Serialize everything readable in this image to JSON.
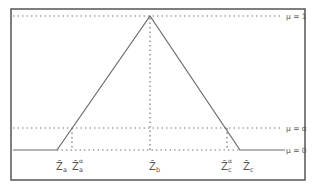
{
  "diagram": {
    "type": "trapezoid-free triangular fuzzy membership function",
    "levels": [
      {
        "id": "mu1",
        "label": "μ = 1"
      },
      {
        "id": "mualpha",
        "label": "μ = α"
      },
      {
        "id": "mu0",
        "label": "μ = 0"
      }
    ],
    "x_labels": [
      {
        "id": "za",
        "base": "Z̃",
        "sub": "a",
        "sup": ""
      },
      {
        "id": "za_alpha",
        "base": "Z̃",
        "sub": "a",
        "sup": "α"
      },
      {
        "id": "zb",
        "base": "Z̃",
        "sub": "b",
        "sup": ""
      },
      {
        "id": "zc_alpha",
        "base": "Z̃",
        "sub": "c",
        "sup": "α"
      },
      {
        "id": "zc",
        "base": "Z̃",
        "sub": "c",
        "sup": ""
      }
    ],
    "colors": {
      "frame": "#555555",
      "curve": "#6a6a6a",
      "dotted": "#777777",
      "text": "#555555"
    }
  }
}
